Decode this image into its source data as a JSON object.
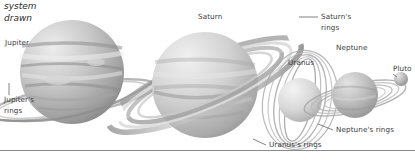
{
  "figure": {
    "title_fragment": "system\ndrawn",
    "background": "#ffffff",
    "label_color": "#3a3a3a",
    "leader_color": "#6d6d6d",
    "rule_color": "#8a8a8a",
    "width": 415,
    "height": 160
  },
  "labels": {
    "jupiter": "Jupiter",
    "jupiter_rings": "Jupiter's\nrings",
    "jupiter_rings_line1": "Jupiter's",
    "jupiter_rings_line2": "rings",
    "saturn": "Saturn",
    "saturn_rings_line1": "Saturn's",
    "saturn_rings_line2": "rings",
    "uranus": "Uranus",
    "neptune": "Neptune",
    "pluto": "Pluto",
    "neptune_rings": "Neptune's rings",
    "uranus_rings": "Uranus's rings"
  },
  "bodies": [
    {
      "name": "Jupiter",
      "cx": 72,
      "cy": 72,
      "r": 52,
      "fill": "#b9b9b9"
    },
    {
      "name": "Saturn",
      "cx": 205,
      "cy": 85,
      "r": 53,
      "fill": "#c4c4c4"
    },
    {
      "name": "Uranus",
      "cx": 300,
      "cy": 100,
      "r": 22,
      "fill": "#c9c9c9"
    },
    {
      "name": "Neptune",
      "cx": 355,
      "cy": 95,
      "r": 23,
      "fill": "#b5b5b5"
    },
    {
      "name": "Pluto",
      "cx": 401,
      "cy": 79,
      "r": 7,
      "fill": "#a8a8a8"
    }
  ],
  "ring_systems": [
    {
      "name": "Jupiter's rings",
      "tilt": -12,
      "count": 2
    },
    {
      "name": "Saturn's rings",
      "tilt": -22,
      "count": 4
    },
    {
      "name": "Uranus's rings",
      "tilt": 78,
      "count": 5
    },
    {
      "name": "Neptune's rings",
      "tilt": -14,
      "count": 4
    }
  ]
}
